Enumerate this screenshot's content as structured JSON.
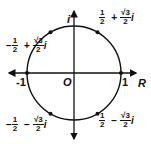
{
  "diagram": {
    "type": "unit-circle-complex-plane",
    "axes": {
      "real_label": "R",
      "imag_label": "i",
      "origin_label": "O",
      "neg_one_label": "-1",
      "pos_one_label": "1"
    },
    "points": [
      {
        "id": "q1",
        "real_sign": "",
        "real_num": "1",
        "real_den": "2",
        "op": "+",
        "imag_num": "√3",
        "imag_den": "2",
        "unit": "i"
      },
      {
        "id": "q2",
        "real_sign": "−",
        "real_num": "1",
        "real_den": "2",
        "op": "+",
        "imag_num": "√3",
        "imag_den": "2",
        "unit": "i"
      },
      {
        "id": "q3",
        "real_sign": "−",
        "real_num": "1",
        "real_den": "2",
        "op": "−",
        "imag_num": "√3",
        "imag_den": "2",
        "unit": "i"
      },
      {
        "id": "q4",
        "real_sign": "",
        "real_num": "1",
        "real_den": "2",
        "op": "−",
        "imag_num": "√3",
        "imag_den": "2",
        "unit": "i"
      }
    ],
    "colors": {
      "stroke": "#111111",
      "background": "#ffffff"
    }
  }
}
